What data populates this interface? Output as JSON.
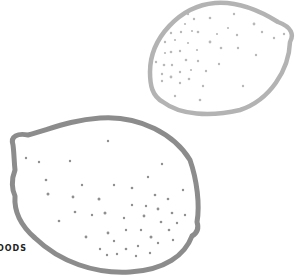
{
  "illustration": {
    "subject": "two lemons line drawing",
    "colors": {
      "top_lemon_outline": "#b3b3b3",
      "top_lemon_dots": "#b8b8b8",
      "bottom_lemon_outline": "#8c8c8c",
      "bottom_lemon_dots": "#8f8f8f",
      "background": "#ffffff"
    }
  },
  "caption": {
    "text": "OODS"
  }
}
